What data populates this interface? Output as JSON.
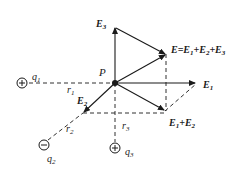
{
  "diagram": {
    "point": {
      "label": "P"
    },
    "charges": [
      {
        "label": "q",
        "sub": "1",
        "sign": "+"
      },
      {
        "label": "q",
        "sub": "2",
        "sign": "−"
      },
      {
        "label": "q",
        "sub": "3",
        "sign": "+"
      }
    ],
    "distances": [
      {
        "label": "r",
        "sub": "1"
      },
      {
        "label": "r",
        "sub": "2"
      },
      {
        "label": "r",
        "sub": "3"
      }
    ],
    "vectors": {
      "E1": {
        "label": "E",
        "sub": "1"
      },
      "E2": {
        "label": "E",
        "sub": "2"
      },
      "E3": {
        "label": "E",
        "sub": "3"
      },
      "E12": {
        "label": "E",
        "sub1": "1",
        "plus": "+",
        "label2": "E",
        "sub2": "2"
      },
      "E": {
        "text": "E=E",
        "s1": "1",
        "p1": "+E",
        "s2": "2",
        "p2": "+E",
        "s3": "3"
      }
    },
    "colors": {
      "line": "#1a1a1a",
      "background": "#ffffff"
    }
  }
}
